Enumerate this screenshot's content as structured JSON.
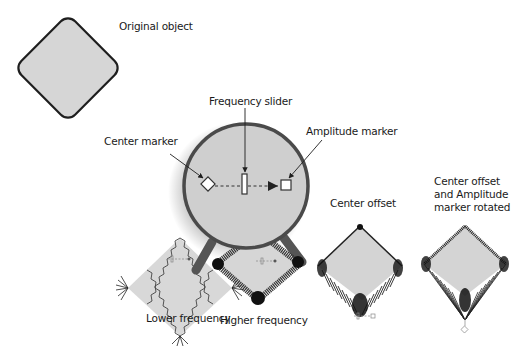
{
  "labels": {
    "original": "Original object",
    "center_marker": "Center marker",
    "frequency_slider": "Frequency slider",
    "amplitude_marker": "Amplitude marker",
    "lower_frequency": "Lower frequency",
    "higher_frequency": "Higher frequency",
    "center_offset": "Center offset",
    "rotated_line1": "Center offset",
    "rotated_line2": "and Amplitude",
    "rotated_line3": "marker rotated"
  },
  "colors": {
    "fill": "#d6d6d6",
    "stroke": "#1e1e1e",
    "magnifier_fill": "#cfcfcf",
    "magnifier_ring": "#4a4a4a",
    "text": "#1a1a1a"
  },
  "markers": {
    "center": "diamond",
    "slider": "vertical-rectangle",
    "amplitude": "square",
    "connector": "dashed-arrow"
  }
}
